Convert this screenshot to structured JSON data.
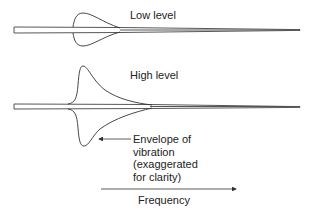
{
  "diagram": {
    "panels": [
      {
        "id": "low",
        "label": "Low level"
      },
      {
        "id": "high",
        "label": "High level"
      }
    ],
    "annotation": {
      "lines": [
        "Envelope of",
        "vibration",
        "(exaggerated",
        "for clarity)"
      ]
    },
    "axis": {
      "label": "Frequency"
    },
    "colors": {
      "stroke": "#333333",
      "text": "#222222",
      "background": "#ffffff"
    }
  }
}
